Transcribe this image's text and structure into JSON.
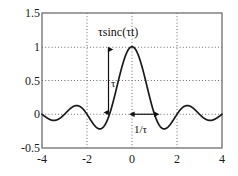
{
  "chart_data": {
    "type": "line",
    "title": "τsinc(τt)",
    "xlabel": "",
    "ylabel": "",
    "xlim": [
      -4,
      4
    ],
    "ylim": [
      -0.5,
      1.5
    ],
    "grid": true,
    "legend": null,
    "xticks": [
      "-4",
      "-2",
      "0",
      "2",
      "4"
    ],
    "xtick_values": [
      -4,
      -2,
      0,
      2,
      4
    ],
    "yticks": [
      "-0.5",
      "0",
      "0.5",
      "1",
      "1.5"
    ],
    "ytick_values": [
      -0.5,
      0,
      0.5,
      1,
      1.5
    ],
    "series": [
      {
        "name": "τsinc(τt)",
        "color": "#1a1a1a",
        "function": "sinc",
        "x": [
          -4.0,
          -3.9,
          -3.8,
          -3.7,
          -3.6,
          -3.5,
          -3.4,
          -3.3,
          -3.2,
          -3.1,
          -3.0,
          -2.9,
          -2.8,
          -2.7,
          -2.6,
          -2.5,
          -2.4,
          -2.3,
          -2.2,
          -2.1,
          -2.0,
          -1.9,
          -1.8,
          -1.7,
          -1.6,
          -1.5,
          -1.4,
          -1.3,
          -1.2,
          -1.1,
          -1.0,
          -0.9,
          -0.8,
          -0.7,
          -0.6,
          -0.5,
          -0.4,
          -0.3,
          -0.2,
          -0.1,
          0.0,
          0.1,
          0.2,
          0.3,
          0.4,
          0.5,
          0.6,
          0.7,
          0.8,
          0.9,
          1.0,
          1.1,
          1.2,
          1.3,
          1.4,
          1.5,
          1.6,
          1.7,
          1.8,
          1.9,
          2.0,
          2.1,
          2.2,
          2.3,
          2.4,
          2.5,
          2.6,
          2.7,
          2.8,
          2.9,
          3.0,
          3.1,
          3.2,
          3.3,
          3.4,
          3.5,
          3.6,
          3.7,
          3.8,
          3.9,
          4.0
        ],
        "y": [
          -0.0,
          0.025,
          0.049,
          0.068,
          0.082,
          0.089,
          0.089,
          0.082,
          0.069,
          0.05,
          0.0,
          -0.033,
          -0.064,
          -0.09,
          -0.109,
          -0.127,
          -0.131,
          -0.128,
          -0.116,
          -0.095,
          0.0,
          0.052,
          -0.104,
          -0.151,
          -0.189,
          -0.212,
          -0.216,
          -0.198,
          -0.156,
          -0.089,
          0.0,
          0.109,
          0.234,
          0.368,
          0.505,
          0.637,
          0.757,
          0.858,
          0.935,
          0.984,
          1.0,
          0.984,
          0.935,
          0.858,
          0.757,
          0.637,
          0.505,
          0.368,
          0.234,
          0.109,
          0.0,
          -0.089,
          -0.156,
          -0.198,
          -0.216,
          -0.212,
          -0.189,
          -0.151,
          -0.104,
          -0.052,
          0.0,
          0.095,
          0.116,
          0.128,
          0.131,
          0.127,
          0.109,
          0.09,
          0.064,
          0.033,
          0.0,
          -0.05,
          -0.069,
          -0.082,
          -0.089,
          -0.089,
          -0.082,
          -0.068,
          -0.049,
          -0.025,
          0.0
        ]
      }
    ],
    "annotations": [
      {
        "name": "title-label",
        "text": "τsinc(τt)",
        "x": 0,
        "y": 1.28
      },
      {
        "name": "tau-amplitude-label",
        "text": "τ",
        "x": -1.36,
        "y": 0.52
      },
      {
        "name": "inverse-tau-width-label",
        "text": "1/τ",
        "x": 0.52,
        "y": -0.165
      }
    ],
    "arrows": [
      {
        "name": "amplitude-double-arrow",
        "orientation": "vertical",
        "x": -1.5,
        "y_from": 1.0,
        "y_to": 0.0,
        "label": "τ"
      },
      {
        "name": "width-double-arrow",
        "orientation": "horizontal",
        "y": 0.0,
        "x_from": 0.0,
        "x_to": 1.0,
        "label": "1/τ"
      }
    ],
    "colors": {
      "curve": "#1a1a1a",
      "grid": "#7a7a7a",
      "axis": "#6e6e6e",
      "text": "#1a1a1a",
      "background": "#ffffff"
    }
  }
}
